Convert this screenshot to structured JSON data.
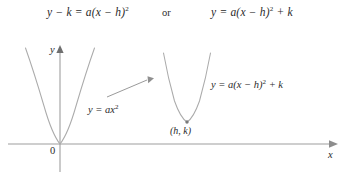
{
  "figure": {
    "type": "math-diagram",
    "formulas": {
      "standard_form": "y − k = a(x − h)",
      "standard_form_exponent": "2",
      "connector": "or",
      "vertex_form_prefix": "y = a(x − h)",
      "vertex_form_exponent": "2",
      "vertex_form_suffix": " + k"
    },
    "axes": {
      "x_label": "x",
      "y_label": "y",
      "origin_label": "0",
      "x_axis_y_px": 144,
      "y_axis_x_px": 60
    },
    "curves": [
      {
        "name": "base-parabola",
        "label_prefix": "y = ax",
        "label_exponent": "2",
        "vertex": {
          "x": 60,
          "y": 144
        },
        "color": "#a9a9a9"
      },
      {
        "name": "shifted-parabola",
        "label_prefix": "y = a(x − h)",
        "label_exponent": "2",
        "label_suffix": " + k",
        "vertex": {
          "x": 187,
          "y": 122
        },
        "vertex_label": "(h, k)",
        "color": "#a9a9a9"
      }
    ],
    "transition_arrow": {
      "name": "shift-arrow",
      "from": {
        "x": 107,
        "y": 96
      },
      "to": {
        "x": 150,
        "y": 78
      },
      "color": "#9a9a9a"
    },
    "colors": {
      "curve": "#a9a9a9",
      "axis": "#9e9e9e",
      "text": "#2a2a2a",
      "background": "#ffffff"
    }
  }
}
